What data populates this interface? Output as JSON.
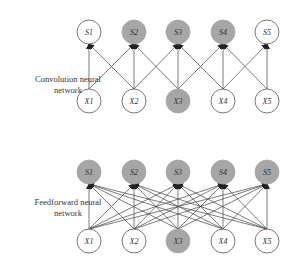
{
  "diagrams": [
    {
      "label_line1": "Convolution neural",
      "label_line2": "network",
      "top_nodes": [
        {
          "name": "S1",
          "shaded": false
        },
        {
          "name": "S2",
          "shaded": true
        },
        {
          "name": "S3",
          "shaded": true
        },
        {
          "name": "S4",
          "shaded": true
        },
        {
          "name": "S5",
          "shaded": false
        }
      ],
      "bottom_nodes": [
        {
          "name": "X1",
          "shaded": false
        },
        {
          "name": "X2",
          "shaded": false
        },
        {
          "name": "X3",
          "shaded": true
        },
        {
          "name": "X4",
          "shaded": false
        },
        {
          "name": "X5",
          "shaded": false
        }
      ],
      "connectivity": "local-3"
    },
    {
      "label_line1": "Feedforward neural",
      "label_line2": "network",
      "top_nodes": [
        {
          "name": "S1",
          "shaded": true
        },
        {
          "name": "S2",
          "shaded": true
        },
        {
          "name": "S3",
          "shaded": true
        },
        {
          "name": "S4",
          "shaded": true
        },
        {
          "name": "S5",
          "shaded": true
        }
      ],
      "bottom_nodes": [
        {
          "name": "X1",
          "shaded": false
        },
        {
          "name": "X2",
          "shaded": false
        },
        {
          "name": "X3",
          "shaded": true
        },
        {
          "name": "X4",
          "shaded": false
        },
        {
          "name": "X5",
          "shaded": false
        }
      ],
      "connectivity": "full"
    }
  ],
  "colors": {
    "shaded_fill": "#a6a6a6",
    "node_stroke": "#555555",
    "edge": "#444444",
    "text": "#333333"
  }
}
